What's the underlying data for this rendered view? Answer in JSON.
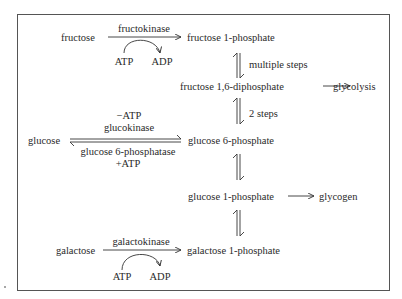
{
  "diagram": {
    "nodes": {
      "fructose": "fructose",
      "fructose_1_phosphate": "fructose 1-phosphate",
      "fructose_1_6_diphosphate": "fructose 1,6-diphosphate",
      "glycolysis": "glycolysis",
      "glucose": "glucose",
      "glucose_6_phosphate": "glucose 6-phosphate",
      "glucose_1_phosphate": "glucose 1-phosphate",
      "glycogen": "glycogen",
      "galactose": "galactose",
      "galactose_1_phosphate": "galactose 1-phosphate"
    },
    "edge_labels": {
      "fructokinase": "fructokinase",
      "fructo_atp": "ATP",
      "fructo_adp": "ADP",
      "multiple_steps": "multiple steps",
      "two_steps": "2 steps",
      "minus_atp": "−ATP",
      "glucokinase": "glucokinase",
      "glucose_6_phosphatase": "glucose 6-phosphatase",
      "plus_atp": "+ATP",
      "galactokinase": "galactokinase",
      "galacto_atp": "ATP",
      "galacto_adp": "ADP"
    },
    "edges": [
      {
        "from": "fructose",
        "to": "fructose 1-phosphate",
        "label": "fructokinase",
        "cofactors": "ATP → ADP"
      },
      {
        "from": "fructose 1-phosphate",
        "to": "fructose 1,6-diphosphate",
        "label": "multiple steps",
        "reversible": true
      },
      {
        "from": "fructose 1,6-diphosphate",
        "to": "glycolysis"
      },
      {
        "from": "fructose 1,6-diphosphate",
        "to": "glucose 6-phosphate",
        "label": "2 steps",
        "reversible": true
      },
      {
        "from": "glucose",
        "to": "glucose 6-phosphate",
        "label": "glucokinase (−ATP)",
        "reverse_label": "glucose 6-phosphatase (+ATP)",
        "reversible": true
      },
      {
        "from": "glucose 6-phosphate",
        "to": "glucose 1-phosphate",
        "reversible": true
      },
      {
        "from": "glucose 1-phosphate",
        "to": "glycogen"
      },
      {
        "from": "glucose 1-phosphate",
        "to": "galactose 1-phosphate",
        "reversible": true
      },
      {
        "from": "galactose",
        "to": "galactose 1-phosphate",
        "label": "galactokinase",
        "cofactors": "ATP → ADP"
      }
    ]
  }
}
